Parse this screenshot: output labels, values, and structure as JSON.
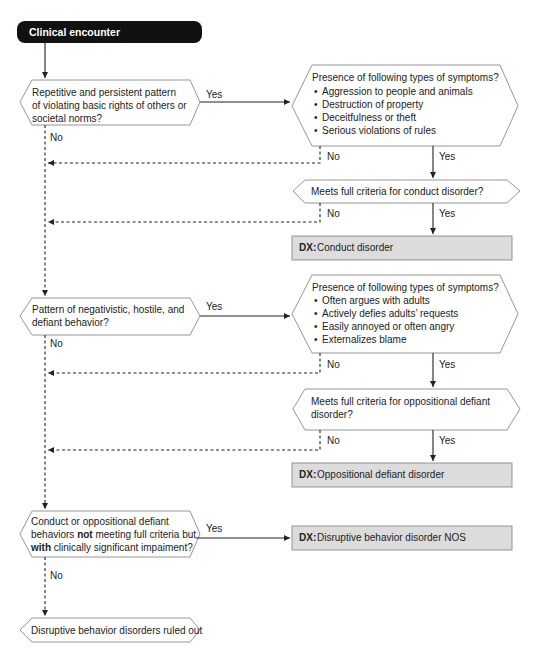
{
  "flowchart": {
    "start": {
      "label": "Clinical encounter"
    },
    "q1": {
      "lines": [
        "Repetitive and persistent pattern",
        "of violating basic rights of others or",
        "societal norms?"
      ],
      "yes_label": "Yes",
      "no_label": "No"
    },
    "cd_symptoms": {
      "title": "Presence of following types of symptoms?",
      "items": [
        "Aggression to people and animals",
        "Destruction of property",
        "Deceitfulness or theft",
        "Serious violations of rules"
      ],
      "yes_label": "Yes",
      "no_label": "No"
    },
    "cd_criteria": {
      "lines": [
        "Meets full criteria for conduct disorder?"
      ],
      "yes_label": "Yes",
      "no_label": "No"
    },
    "dx_cd": {
      "prefix": "DX:",
      "label": "Conduct disorder"
    },
    "q2": {
      "lines": [
        "Pattern of negativistic, hostile, and",
        "defiant behavior?"
      ],
      "yes_label": "Yes",
      "no_label": "No"
    },
    "odd_symptoms": {
      "title": "Presence of following types of symptoms?",
      "items": [
        "Often argues with adults",
        "Actively defies adults’ requests",
        "Easily annoyed or often angry",
        "Externalizes blame"
      ],
      "yes_label": "Yes",
      "no_label": "No"
    },
    "odd_criteria": {
      "lines": [
        "Meets full criteria for oppositional defiant",
        "disorder?"
      ],
      "yes_label": "Yes",
      "no_label": "No"
    },
    "dx_odd": {
      "prefix": "DX:",
      "label": "Oppositional defiant disorder"
    },
    "q3": {
      "line1": "Conduct or oppositional defiant",
      "line2_pre": "behaviors ",
      "line2_bold": "not",
      "line2_post": " meeting full criteria but",
      "line3_bold": "with",
      "line3_post": " clinically significant impaiment?",
      "yes_label": "Yes",
      "no_label": "No"
    },
    "dx_nos": {
      "prefix": "DX:",
      "label": "Disruptive behavior disorder NOS"
    },
    "ruled_out": {
      "label": "Disruptive behavior disorders ruled out"
    },
    "colors": {
      "start_fill": "#111111",
      "dx_fill": "#dcdcdc",
      "outline": "#8a8a8a",
      "arrow": "#222222"
    }
  }
}
